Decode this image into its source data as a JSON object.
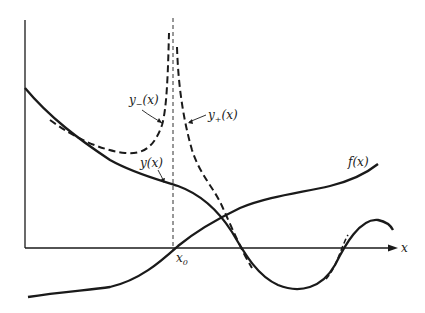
{
  "diagram": {
    "axis_label_x": "x",
    "point_label": "x",
    "point_subscript": "0",
    "curves": {
      "y": {
        "label": "y(x)",
        "style": "solid"
      },
      "f": {
        "label": "f(x)",
        "style": "solid"
      },
      "y_minus": {
        "label_base": "y",
        "label_sub": "−",
        "label_arg": "(x)",
        "style": "dashed"
      },
      "y_plus": {
        "label_base": "y",
        "label_sub": "+",
        "label_arg": "(x)",
        "style": "dashed"
      }
    },
    "colors": {
      "ink": "#1a1a1a",
      "background": "#ffffff"
    }
  }
}
